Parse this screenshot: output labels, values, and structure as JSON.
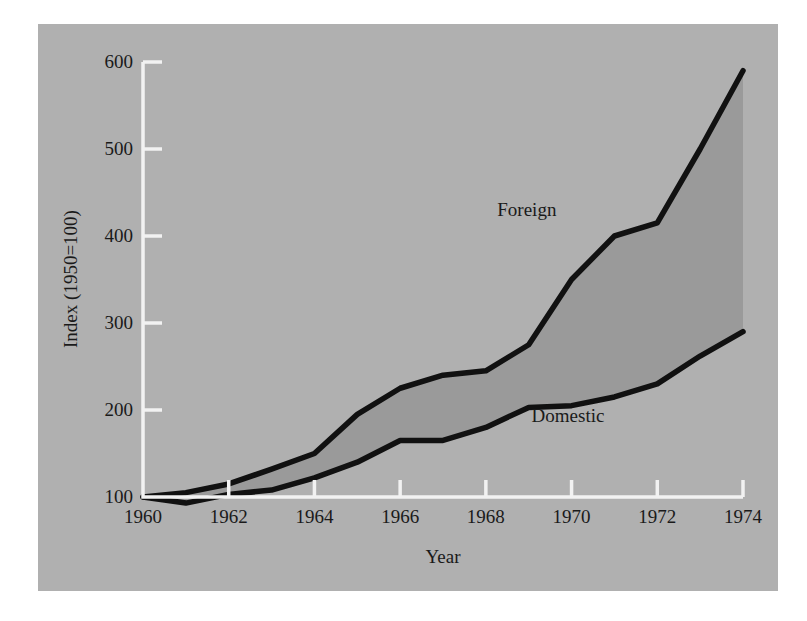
{
  "chart_data": {
    "type": "line",
    "title": "",
    "subtitle": "",
    "xlabel": "Year",
    "ylabel": "Index (1950=100)",
    "x": [
      1960,
      1961,
      1962,
      1963,
      1964,
      1965,
      1966,
      1967,
      1968,
      1969,
      1970,
      1971,
      1972,
      1973,
      1974
    ],
    "xlim": [
      1960,
      1974
    ],
    "ylim": [
      100,
      600
    ],
    "xticks": [
      1960,
      1962,
      1964,
      1966,
      1968,
      1970,
      1972,
      1974
    ],
    "xtick_labels": [
      "1960",
      "1962",
      "1964",
      "1966",
      "1968",
      "1970",
      "1972",
      "1974"
    ],
    "yticks": [
      100,
      200,
      300,
      400,
      500,
      600
    ],
    "ytick_labels": [
      "100",
      "200",
      "300",
      "400",
      "500",
      "600"
    ],
    "grid": false,
    "legend_position": "inline-annotation",
    "series": [
      {
        "name": "Foreign",
        "values": [
          100,
          105,
          115,
          132,
          150,
          195,
          225,
          240,
          245,
          275,
          350,
          400,
          415,
          500,
          590
        ]
      },
      {
        "name": "Domestic",
        "values": [
          100,
          93,
          103,
          108,
          122,
          140,
          165,
          165,
          180,
          203,
          205,
          215,
          230,
          262,
          290
        ]
      }
    ],
    "annotations": [
      {
        "text": "Foreign",
        "x": 1969.2,
        "y": 430
      },
      {
        "text": "Domestic",
        "x": 1970.0,
        "y": 193
      }
    ],
    "colors": {
      "panel_background": "#b0b0b0",
      "band_fill": "#9a9a9a",
      "line": "#111111",
      "axis": "#f2f2f2",
      "text": "#1a1a1a",
      "page_background": "#ffffff"
    }
  }
}
